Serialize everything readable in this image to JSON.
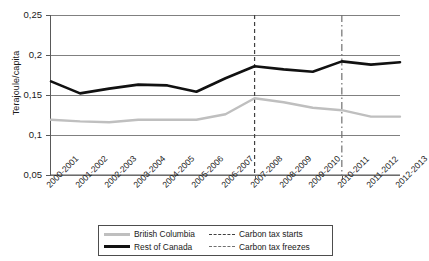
{
  "chart_data": {
    "type": "line",
    "title": "",
    "xlabel": "",
    "ylabel": "Terajoule/capita",
    "ylim": [
      0.05,
      0.25
    ],
    "ytick_labels": [
      "0,25",
      "0,2",
      "0,15",
      "0,1",
      "0,05"
    ],
    "ytick_values": [
      0.25,
      0.2,
      0.15,
      0.1,
      0.05
    ],
    "grid": true,
    "legend_position": "bottom",
    "categories": [
      "2000-2001",
      "2001-2002",
      "2002-2003",
      "2003-2004",
      "2004-2005",
      "2005-2006",
      "2006-2007",
      "2007-2008",
      "2008-2009",
      "2009-2010",
      "2010-2011",
      "2011-2012",
      "2012-2013"
    ],
    "series": [
      {
        "name": "British Columbia",
        "color": "#bfbfbf",
        "values": [
          0.119,
          0.117,
          0.116,
          0.119,
          0.119,
          0.119,
          0.126,
          0.146,
          0.141,
          0.134,
          0.131,
          0.123,
          0.123
        ]
      },
      {
        "name": "Rest of Canada",
        "color": "#111111",
        "values": [
          0.167,
          0.152,
          0.158,
          0.163,
          0.162,
          0.154,
          0.171,
          0.186,
          0.182,
          0.179,
          0.192,
          0.188,
          0.191
        ]
      }
    ],
    "reference_lines": [
      {
        "name": "Carbon tax starts",
        "category": "2007-2008",
        "style": "dashed",
        "color": "#404040"
      },
      {
        "name": "Carbon tax freezes",
        "category": "2010-2011",
        "style": "dash-dot",
        "color": "#707070"
      }
    ],
    "legend": [
      {
        "label": "British Columbia",
        "swatch": "line-light-gray"
      },
      {
        "label": "Rest of Canada",
        "swatch": "line-black"
      },
      {
        "label": "Carbon tax starts",
        "swatch": "line-dashed"
      },
      {
        "label": "Carbon tax freezes",
        "swatch": "line-dash-dot"
      }
    ]
  }
}
